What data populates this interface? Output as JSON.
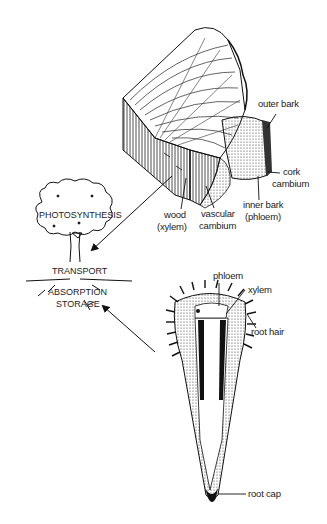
{
  "diagram": {
    "trunk_labels": {
      "outer_bark": "outer bark",
      "cork_cambium_1": "cork",
      "cork_cambium_2": "cambium",
      "inner_bark_1": "inner bark",
      "inner_bark_2": "(phloem)",
      "wood_1": "wood",
      "wood_2": "(xylem)",
      "vascular_cambium_1": "vascular",
      "vascular_cambium_2": "cambium"
    },
    "tree_labels": {
      "photosynthesis": "PHOTOSYNTHESIS",
      "transport": "TRANSPORT",
      "absorption": "ABSORPTION",
      "storage": "STORAGE"
    },
    "root_labels": {
      "phloem": "phloem",
      "xylem": "xylem",
      "root_hair": "root hair",
      "root_cap": "root cap"
    },
    "colors": {
      "ink": "#1a1a1a",
      "background": "#ffffff"
    }
  }
}
